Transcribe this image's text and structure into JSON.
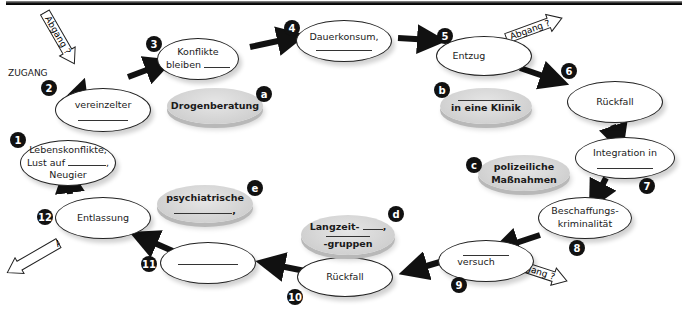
{
  "diagram": {
    "type": "cycle",
    "entry_label": "ZUGANG",
    "exit_label": "Abgang ?",
    "steps": [
      {
        "num": "1",
        "lines": [
          "Lebenskonflikte,",
          "Lust auf ______,",
          "Neugier"
        ]
      },
      {
        "num": "2",
        "lines": [
          "vereinzelter",
          "________"
        ]
      },
      {
        "num": "3",
        "lines": [
          "Konflikte",
          "bleiben ______"
        ]
      },
      {
        "num": "4",
        "lines": [
          "Dauerkonsum,",
          "________"
        ]
      },
      {
        "num": "5",
        "lines": [
          "Entzug"
        ]
      },
      {
        "num": "6",
        "lines": [
          "Rückfall"
        ]
      },
      {
        "num": "7",
        "lines": [
          "Integration in",
          "________"
        ]
      },
      {
        "num": "8",
        "lines": [
          "Beschaffungs-",
          "kriminalität"
        ]
      },
      {
        "num": "9",
        "lines": [
          "________",
          "versuch"
        ]
      },
      {
        "num": "10",
        "lines": [
          "Rückfall"
        ]
      },
      {
        "num": "11",
        "lines": [
          "________"
        ]
      },
      {
        "num": "12",
        "lines": [
          "Entlassung"
        ]
      }
    ],
    "measures": [
      {
        "letter": "a",
        "lines": [
          "Drogenberatung"
        ]
      },
      {
        "letter": "b",
        "lines": [
          "________",
          "in eine Klinik"
        ]
      },
      {
        "letter": "c",
        "lines": [
          "polizeiliche",
          "Maßnahmen"
        ]
      },
      {
        "letter": "d",
        "lines": [
          "Langzeit- ______,",
          "________",
          "-gruppen"
        ]
      },
      {
        "letter": "e",
        "lines": [
          "psychiatrische",
          "______,"
        ]
      }
    ]
  }
}
